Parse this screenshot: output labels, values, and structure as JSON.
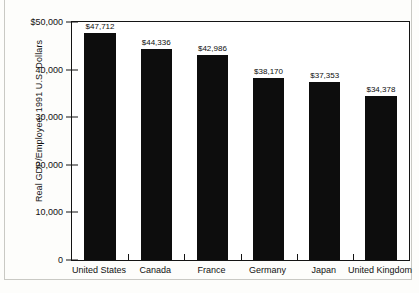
{
  "chart_data": {
    "type": "bar",
    "title": "",
    "xlabel": "",
    "ylabel": "Real GDP/Employee, 1991 U.S. Dollars",
    "categories": [
      "United States",
      "Canada",
      "France",
      "Germany",
      "Japan",
      "United Kingdom"
    ],
    "values": [
      47712,
      44336,
      42986,
      38170,
      37353,
      34378
    ],
    "value_labels": [
      "$47,712",
      "$44,336",
      "$42,986",
      "$38,170",
      "$37,353",
      "$34,378"
    ],
    "ylim": [
      0,
      50000
    ],
    "ytick_values": [
      0,
      10000,
      20000,
      30000,
      40000,
      50000
    ],
    "ytick_labels": [
      "0",
      "10,000",
      "20,000",
      "30,000",
      "40,000",
      "$50,000"
    ],
    "grid": false,
    "legend": null,
    "bar_color": "#0d0d0d",
    "background_color": "#ffffff",
    "axis_color": "#141414"
  }
}
